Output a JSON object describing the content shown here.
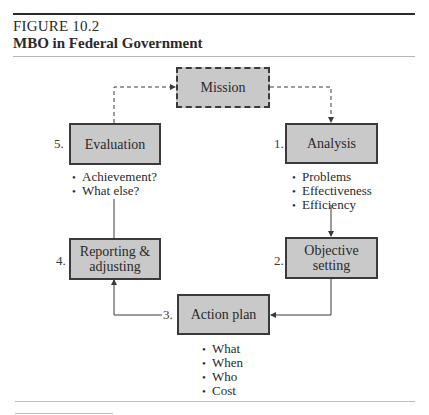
{
  "figure": {
    "label": "FIGURE 10.2",
    "title": "MBO in Federal Government"
  },
  "diagram": {
    "mission": {
      "label": "Mission"
    },
    "steps": [
      {
        "number": "1.",
        "label": "Analysis",
        "bullets": [
          "Problems",
          "Effectiveness",
          "Efficiency"
        ]
      },
      {
        "number": "2.",
        "label_line1": "Objective",
        "label_line2": "setting",
        "bullets": []
      },
      {
        "number": "3.",
        "label": "Action plan",
        "bullets": [
          "What",
          "When",
          "Who",
          "Cost"
        ]
      },
      {
        "number": "4.",
        "label_line1": "Reporting &",
        "label_line2": "adjusting",
        "bullets": []
      },
      {
        "number": "5.",
        "label": "Evaluation",
        "bullets": [
          "Achievement?",
          "What else?"
        ]
      }
    ],
    "colors": {
      "box_fill": "#c9c9c9",
      "box_border": "#3a3a3a",
      "line": "#3a3a3a"
    }
  }
}
